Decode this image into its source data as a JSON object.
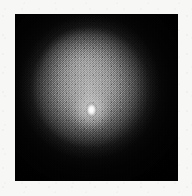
{
  "figure": {
    "kind": "astronomical-image",
    "caption": ""
  },
  "plate": {
    "background_color": "#050505",
    "paper_color": "#f7f7f5",
    "left": 15,
    "top": 14,
    "width": 163,
    "height": 167,
    "texture": "dithered-halftone-grain"
  },
  "halo": {
    "name": "diffuse-nebulosity",
    "center_x": 90,
    "center_y": 87,
    "peak_gray": "#b0b0b0",
    "outer_gray": "#141414",
    "shape": "rounded-square"
  },
  "nucleus": {
    "name": "point-source",
    "center_x": 91,
    "center_y": 110,
    "core_color": "#ffffff",
    "glow_color": "#e2e2e2",
    "width": 13,
    "height": 17,
    "elongation": "vertical"
  },
  "chart_data": {
    "type": "heatmap",
    "title": "",
    "xlabel": "",
    "ylabel": "",
    "colormap": "grayscale",
    "value_range": [
      0,
      255
    ],
    "legend": "none",
    "grid": false,
    "annotations": [],
    "features": [
      {
        "label": "nucleus",
        "x": 91,
        "y": 110,
        "peak_value": 255,
        "fwhm_px": 9
      },
      {
        "label": "halo",
        "x": 90,
        "y": 87,
        "peak_value": 176,
        "extent_px": 130
      },
      {
        "label": "sky-background",
        "x": 20,
        "y": 175,
        "peak_value": 5,
        "extent_px": 0
      }
    ],
    "radial_profile": {
      "radius_px": [
        0,
        5,
        10,
        20,
        35,
        50,
        65,
        80,
        95
      ],
      "value": [
        255,
        190,
        150,
        140,
        128,
        104,
        72,
        34,
        8
      ]
    }
  }
}
